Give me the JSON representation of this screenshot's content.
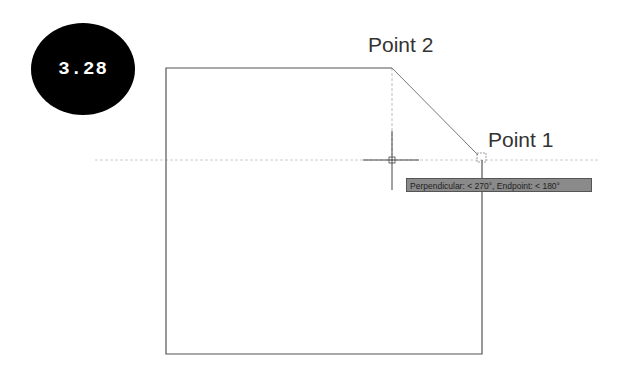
{
  "figure": {
    "number": "3.28",
    "labels": {
      "point2": "Point 2",
      "point1": "Point 1"
    },
    "tooltip": "Perpendicular: < 270°, Endpoint: < 180°",
    "colors": {
      "badge_bg": "#000000",
      "line": "#555555",
      "tracking": "#bbbbbb",
      "tooltip_bg": "#8a8a8a"
    }
  }
}
